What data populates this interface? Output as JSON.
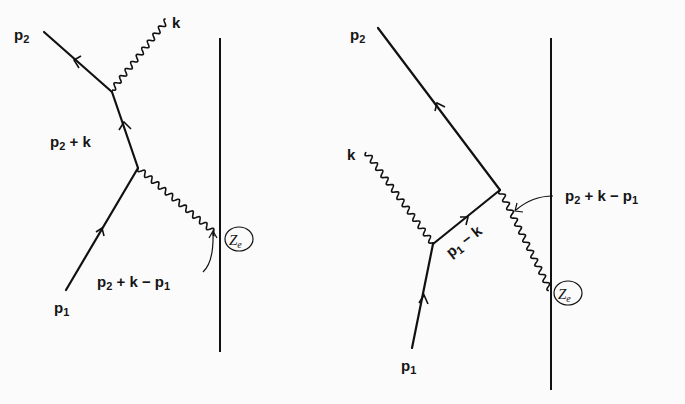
{
  "figure": {
    "left_diagram": {
      "labels": {
        "outgoing_electron": {
          "base": "p",
          "sub": "2"
        },
        "photon": "k",
        "internal_electron": {
          "parts": [
            "p",
            "2",
            " + k"
          ]
        },
        "momentum_transfer": {
          "parts": [
            "p",
            "2",
            " + k − p",
            "1"
          ]
        },
        "incoming_electron": {
          "base": "p",
          "sub": "1"
        },
        "nucleus": {
          "base": "Z",
          "sub": "e"
        }
      }
    },
    "right_diagram": {
      "labels": {
        "outgoing_electron": {
          "base": "p",
          "sub": "2"
        },
        "photon": "k",
        "internal_electron": {
          "parts": [
            "p",
            "1",
            " − k"
          ]
        },
        "momentum_transfer": {
          "parts": [
            "p",
            "2",
            " + k − p",
            "1"
          ]
        },
        "incoming_electron": {
          "base": "p",
          "sub": "1"
        },
        "nucleus": {
          "base": "Z",
          "sub": "e"
        }
      }
    }
  }
}
